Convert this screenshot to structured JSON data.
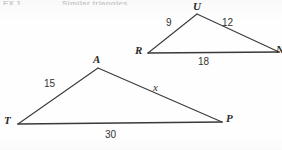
{
  "page": {
    "background_color": "#fefefe",
    "ink_color": "#3a3a3a",
    "text_color": "#2b2b2b"
  },
  "header": {
    "remnant_left": "EX 1",
    "remnant_right": "Similar triangles",
    "note": "clipped/faded text at top edge"
  },
  "figure": {
    "type": "similar-triangles-diagram",
    "triangles": [
      {
        "id": "upper",
        "name": "RUN",
        "vertices": [
          {
            "label": "U",
            "x": 197,
            "y": 14
          },
          {
            "label": "R",
            "x": 148,
            "y": 53
          },
          {
            "label": "N",
            "x": 278,
            "y": 52
          }
        ],
        "sides": [
          {
            "from": "R",
            "to": "U",
            "measure": "9"
          },
          {
            "from": "U",
            "to": "N",
            "measure": "12"
          },
          {
            "from": "R",
            "to": "N",
            "measure": "18"
          }
        ]
      },
      {
        "id": "lower",
        "name": "TAP",
        "vertices": [
          {
            "label": "A",
            "x": 98,
            "y": 68
          },
          {
            "label": "T",
            "x": 18,
            "y": 124
          },
          {
            "label": "P",
            "x": 222,
            "y": 122
          }
        ],
        "sides": [
          {
            "from": "T",
            "to": "A",
            "measure": "15"
          },
          {
            "from": "A",
            "to": "P",
            "measure": "x"
          },
          {
            "from": "T",
            "to": "P",
            "measure": "30"
          }
        ]
      }
    ]
  },
  "labels": {
    "upper": {
      "vertex_u": "U",
      "vertex_r": "R",
      "vertex_n": "N",
      "side_ru": "9",
      "side_un": "12",
      "side_rn": "18"
    },
    "lower": {
      "vertex_a": "A",
      "vertex_t": "T",
      "vertex_p": "P",
      "side_ta": "15",
      "side_ap": "x",
      "side_tp": "30"
    }
  }
}
